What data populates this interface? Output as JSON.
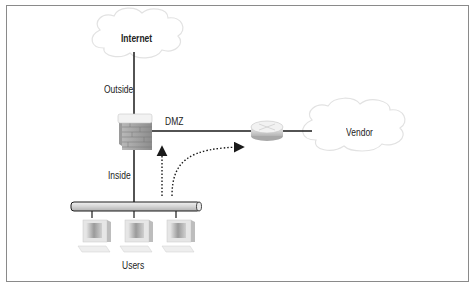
{
  "diagram": {
    "type": "network-topology",
    "nodes": {
      "internet": {
        "label": "Internet",
        "shape": "cloud"
      },
      "vendor": {
        "label": "Vendor",
        "shape": "cloud"
      },
      "firewall": {
        "label": "",
        "shape": "firewall-brick"
      },
      "router": {
        "label": "",
        "shape": "router"
      },
      "lan_bus": {
        "label": "",
        "shape": "bus-pipe"
      },
      "users": {
        "label": "Users",
        "count": 3,
        "shape": "workstation"
      }
    },
    "links": {
      "outside": {
        "label": "Outside",
        "from": "internet",
        "to": "firewall"
      },
      "dmz": {
        "label": "DMZ",
        "from": "firewall",
        "to": "router"
      },
      "inside": {
        "label": "Inside",
        "from": "firewall",
        "to": "lan_bus"
      },
      "router_vendor": {
        "label": "",
        "from": "router",
        "to": "vendor"
      }
    },
    "flows": [
      {
        "from": "lan_bus",
        "to": "firewall",
        "style": "dotted-arrow"
      },
      {
        "from": "lan_bus",
        "to": "router",
        "style": "dotted-curved-arrow"
      }
    ],
    "colors": {
      "line": "#1a1a1a",
      "cloud_stroke": "#e2e2e2",
      "frame": "#8a8a8a",
      "brick": "#a9a9a9",
      "pipe": "#d8d8d8"
    }
  }
}
